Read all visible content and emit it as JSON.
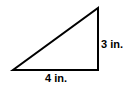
{
  "figure": {
    "type": "right-triangle-diagram",
    "background_color": "#ffffff",
    "stroke_color": "#000000",
    "stroke_width": 2,
    "vertices": {
      "bottom_left": [
        13,
        70
      ],
      "bottom_right": [
        98,
        70
      ],
      "top_right": [
        98,
        8
      ]
    },
    "labels": {
      "vertical_leg": "3 in.",
      "horizontal_leg": "4 in."
    }
  },
  "chart_data": {
    "type": "diagram",
    "title": "",
    "shape": "right triangle",
    "sides": [
      {
        "name": "vertical leg",
        "label": "3 in.",
        "value": 3,
        "unit": "in."
      },
      {
        "name": "horizontal leg",
        "label": "4 in.",
        "value": 4,
        "unit": "in."
      }
    ]
  }
}
